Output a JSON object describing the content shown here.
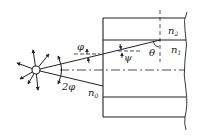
{
  "diagram": {
    "type": "optical-fiber-light-coupling",
    "labels": {
      "phi": "φ",
      "psi": "ψ",
      "theta": "θ",
      "two_phi": "2φ",
      "n0_base": "n",
      "n0_sub": "0",
      "n1_base": "n",
      "n1_sub": "1",
      "n2_base": "n",
      "n2_sub": "2"
    },
    "colors": {
      "line": "#222222",
      "background": "#ffffff"
    }
  }
}
